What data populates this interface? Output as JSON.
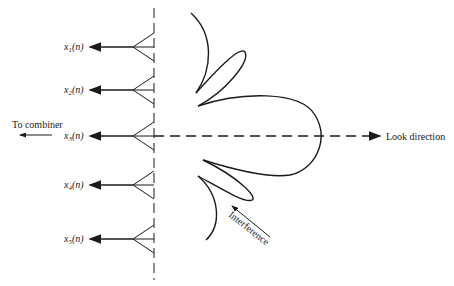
{
  "diagram": {
    "title": "",
    "colors": {
      "ink": "#1a1a1a",
      "background": "#ffffff"
    },
    "array_axis": {
      "style": "dashed",
      "x": 154
    },
    "sensors": [
      {
        "id": 1,
        "label": "x",
        "sub": "1",
        "arg": "(n)",
        "y": 47
      },
      {
        "id": 2,
        "label": "x",
        "sub": "2",
        "arg": "(n)",
        "y": 90
      },
      {
        "id": 3,
        "label": "x",
        "sub": "3",
        "arg": "(n)",
        "y": 136
      },
      {
        "id": 4,
        "label": "x",
        "sub": "4",
        "arg": "(n)",
        "y": 185
      },
      {
        "id": 5,
        "label": "x",
        "sub": "5",
        "arg": "(n)",
        "y": 239
      }
    ],
    "to_combiner_label": "To combiner",
    "look_direction_label": "Look direction",
    "interference_label": "Interference",
    "beam_pattern": {
      "main_lobe": "toward look direction",
      "side_lobes": 2,
      "null_direction": "interference"
    }
  }
}
